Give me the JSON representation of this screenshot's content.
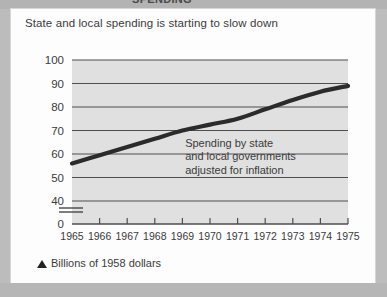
{
  "page": {
    "clipped_top_text": "SPENDING",
    "headline": "State and local spending is starting to slow down",
    "footer_note": "Billions of 1958 dollars",
    "footer_marker_icon": "triangle-up-icon",
    "colors": {
      "page_background": "#b9b9b9",
      "card_background": "#fdfdfd",
      "plot_background": "#e0e0e0",
      "gridline": "#4e4e4e",
      "series_line": "#2b2b2b",
      "text": "#3b3b3b"
    }
  },
  "chart_data": {
    "type": "line",
    "title": "State and local spending is starting to slow down",
    "subtitle": "Billions of 1958 dollars",
    "xlabel": "",
    "ylabel": "",
    "x": [
      1965,
      1966,
      1967,
      1968,
      1969,
      1970,
      1971,
      1972,
      1973,
      1974,
      1975
    ],
    "categories": [
      "1965",
      "1966",
      "1967",
      "1968",
      "1969",
      "1970",
      "1971",
      "1972",
      "1973",
      "1974",
      "1975"
    ],
    "series": [
      {
        "name": "Spending by state and local governments adjusted for inflation",
        "values": [
          56,
          59.5,
          63,
          66.5,
          70,
          72.5,
          75,
          79,
          83,
          86.5,
          89
        ]
      }
    ],
    "ylim": [
      0,
      100
    ],
    "yticks": [
      "0",
      "40",
      "50",
      "60",
      "70",
      "80",
      "90",
      "100"
    ],
    "ytick_values": [
      0,
      40,
      50,
      60,
      70,
      80,
      90,
      100
    ],
    "axis_break": {
      "between": [
        0,
        40
      ],
      "style": "double-slash"
    },
    "grid": true,
    "grid_axis": "y",
    "legend": "none",
    "annotations": [
      {
        "lines": [
          "Spending by state",
          "and local governments",
          "adjusted for inflation"
        ],
        "x": 1969.1,
        "y": 63
      }
    ]
  }
}
